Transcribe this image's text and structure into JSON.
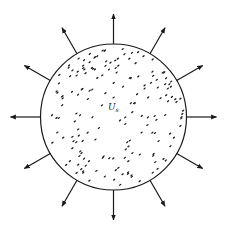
{
  "diagram": {
    "center": [
      113.5,
      117
    ],
    "radius": 73,
    "arrow_length": 30,
    "arrow_count": 12,
    "arrow_angle_step_deg": 30,
    "stroke_color": "#1a1a1a",
    "label": {
      "main": "U",
      "subscript": "s",
      "position": [
        108,
        110
      ]
    },
    "dot_count": 180
  }
}
